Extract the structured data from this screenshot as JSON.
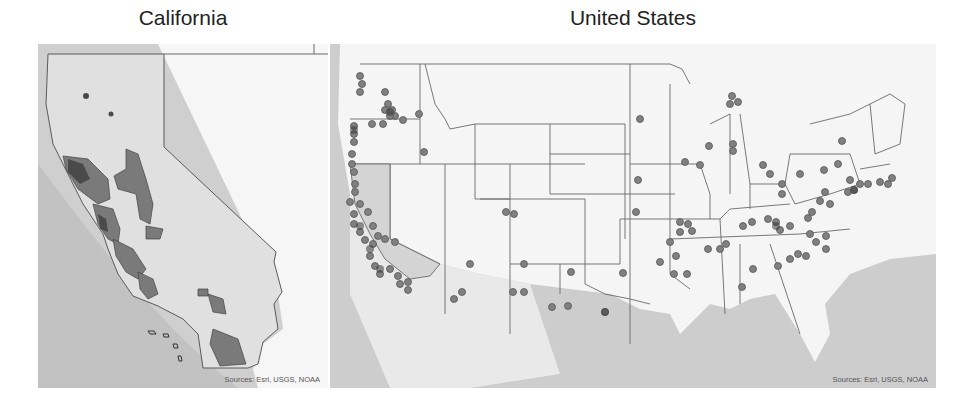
{
  "maps": [
    {
      "title": "California",
      "credit": "Sources: Esri, USGS, NOAA",
      "legend_note": "Shaded polygons indicate study regions in coastal and central California"
    },
    {
      "title": "United States",
      "credit": "Sources: Esri, USGS, NOAA",
      "legend_note": "Circles indicate site locations; darker = overlapping sites"
    }
  ],
  "colors": {
    "ocean": "#c9c9c9",
    "land": "#f4f4f4",
    "highlight_state": "#dcdcdc",
    "region_fill": "#7a7a7a",
    "region_dark": "#4a4a4a",
    "marker": "#808080",
    "marker_stroke": "#555555",
    "border": "#6a6a6a"
  }
}
